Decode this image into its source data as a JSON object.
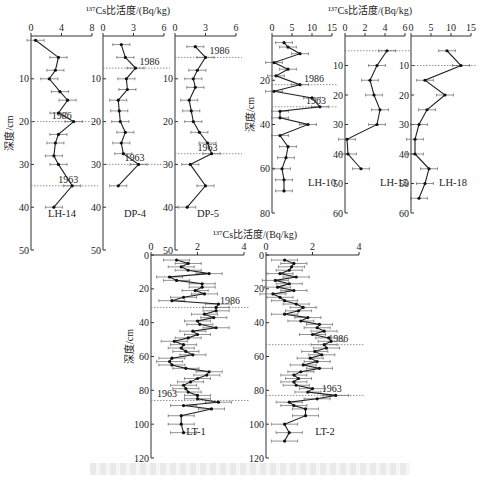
{
  "figure": {
    "top_group_title": "¹³⁷Cs比活度/(Bq/kg)",
    "bottom_group_title": "¹³⁷Cs比活度/(Bq/kg)",
    "ylabel": "深度/cm",
    "caption": "图   ¹³⁷Cs比活度随深度变化"
  },
  "chart_data": [
    {
      "type": "line",
      "title": "LH-14",
      "xlabel": "¹³⁷Cs比活度/(Bq/kg)",
      "ylabel": "深度/cm",
      "xlim": [
        0,
        8
      ],
      "xticks": [
        0,
        4,
        8
      ],
      "ylim": [
        0,
        50
      ],
      "yticks": [
        10,
        20,
        30,
        40,
        50
      ],
      "depth": [
        1,
        5,
        8,
        10,
        13,
        15,
        18,
        20,
        23,
        25,
        28,
        30,
        35,
        40
      ],
      "values": [
        0.6,
        3.6,
        3.2,
        2.4,
        3.8,
        4.8,
        3.6,
        5.6,
        3.6,
        3.2,
        3.0,
        3.6,
        5.4,
        3.0
      ],
      "markers": [
        {
          "label": "1986",
          "depth": 20
        },
        {
          "label": "1963",
          "depth": 35
        }
      ]
    },
    {
      "type": "line",
      "title": "DP-4",
      "xlabel": "¹³⁷Cs比活度/(Bq/kg)",
      "ylabel": "深度/cm",
      "xlim": [
        0,
        6
      ],
      "xticks": [
        0,
        3,
        6
      ],
      "ylim": [
        0,
        50
      ],
      "yticks": [
        10,
        20,
        30,
        40,
        50
      ],
      "depth": [
        2,
        5,
        7.5,
        10,
        12.5,
        15,
        17.5,
        20,
        22.5,
        25,
        27.5,
        30,
        35
      ],
      "values": [
        1.8,
        2.2,
        3.2,
        2.3,
        2.4,
        1.5,
        1.6,
        1.7,
        2.2,
        1.8,
        2.0,
        3.5,
        1.5
      ],
      "markers": [
        {
          "label": "1986",
          "depth": 7.5
        },
        {
          "label": "1963",
          "depth": 30
        }
      ]
    },
    {
      "type": "line",
      "title": "DP-5",
      "xlabel": "¹³⁷Cs比活度/(Bq/kg)",
      "ylabel": "深度/cm",
      "xlim": [
        0,
        6
      ],
      "xticks": [
        0,
        3,
        6
      ],
      "ylim": [
        0,
        50
      ],
      "yticks": [
        10,
        20,
        30,
        40,
        50
      ],
      "depth": [
        2.5,
        5,
        8,
        10,
        12,
        15,
        17.5,
        20,
        22.5,
        25,
        27.5,
        30,
        35,
        40
      ],
      "values": [
        2.0,
        3.0,
        2.2,
        1.8,
        2.0,
        1.4,
        1.6,
        1.8,
        2.4,
        3.2,
        3.6,
        1.5,
        3.0,
        1.2
      ],
      "markers": [
        {
          "label": "1986",
          "depth": 5
        },
        {
          "label": "1963",
          "depth": 27.5
        }
      ]
    },
    {
      "type": "line",
      "title": "LH-10",
      "xlabel": "¹³⁷Cs比活度/(Bq/kg)",
      "ylabel": "深度/cm",
      "xlim": [
        0,
        15
      ],
      "xticks": [
        0,
        5,
        10,
        15
      ],
      "ylim": [
        0,
        80
      ],
      "yticks": [
        20,
        40,
        60,
        80
      ],
      "depth": [
        3,
        5,
        8,
        12,
        15,
        18,
        22,
        25,
        28,
        32,
        34,
        37,
        40,
        45,
        50,
        55,
        60,
        65,
        70
      ],
      "values": [
        3,
        4,
        7,
        0.5,
        4,
        1,
        7,
        0.5,
        10,
        12,
        2,
        2,
        9,
        2,
        4,
        3.5,
        2.5,
        3,
        3
      ],
      "markers": [
        {
          "label": "1986",
          "depth": 22
        },
        {
          "label": "1963",
          "depth": 32
        }
      ]
    },
    {
      "type": "line",
      "title": "LH-15",
      "xlabel": "¹³⁷Cs比活度/(Bq/kg)",
      "ylabel": "深度/cm",
      "xlim": [
        0,
        6
      ],
      "xticks": [
        0,
        2,
        4,
        6
      ],
      "ylim": [
        0,
        60
      ],
      "yticks": [
        10,
        20,
        30,
        40,
        50,
        60
      ],
      "depth": [
        5,
        10,
        15,
        20,
        25,
        30,
        35,
        40,
        45
      ],
      "values": [
        4.2,
        3.2,
        2.5,
        2.9,
        3.5,
        3.2,
        0.2,
        0.3,
        1.6
      ],
      "markers": [
        {
          "label": "",
          "depth": 5
        }
      ]
    },
    {
      "type": "line",
      "title": "LH-18",
      "xlabel": "¹³⁷Cs比活度/(Bq/kg)",
      "ylabel": "深度/cm",
      "xlim": [
        0,
        15
      ],
      "xticks": [
        0,
        5,
        10,
        15
      ],
      "ylim": [
        0,
        60
      ],
      "yticks": [
        10,
        20,
        30,
        40,
        50,
        60
      ],
      "depth": [
        5,
        10,
        15,
        20,
        25,
        30,
        35,
        40,
        45,
        50,
        55
      ],
      "values": [
        9,
        12.5,
        3.5,
        8.5,
        4.0,
        2.0,
        1.0,
        1.0,
        4.5,
        3.5,
        2.0
      ],
      "markers": [
        {
          "label": "",
          "depth": 10
        }
      ]
    },
    {
      "type": "line",
      "title": "LT-1",
      "xlabel": "¹³⁷Cs比活度/(Bq/kg)",
      "ylabel": "深度/cm",
      "xlim": [
        0,
        4
      ],
      "xticks": [
        0,
        2,
        4
      ],
      "ylim": [
        0,
        120
      ],
      "yticks": [
        0,
        20,
        40,
        60,
        80,
        100,
        120
      ],
      "depth": [
        3,
        5,
        7,
        9,
        11,
        13,
        15,
        17,
        19,
        21,
        23,
        25,
        27,
        29,
        31,
        33,
        35,
        37,
        39,
        41,
        43,
        45,
        47,
        49,
        51,
        53,
        55,
        57,
        59,
        61,
        63,
        65,
        67,
        69,
        71,
        73,
        75,
        77,
        79,
        81,
        83,
        85,
        87,
        89,
        91,
        95,
        100,
        105
      ],
      "values": [
        1.1,
        1.6,
        1.3,
        1.6,
        2.5,
        0.8,
        1.1,
        2.2,
        2.2,
        1.9,
        2.3,
        1.4,
        0.9,
        2.9,
        2.8,
        2.8,
        2.3,
        2.7,
        2.0,
        2.1,
        2.8,
        1.8,
        2.0,
        1.6,
        1.0,
        1.4,
        1.3,
        1.5,
        1.8,
        0.9,
        0.8,
        0.9,
        1.5,
        2.5,
        2.4,
        2.0,
        1.7,
        1.4,
        1.5,
        1.6,
        2.0,
        2.0,
        2.9,
        1.4,
        2.6,
        1.3,
        1.3,
        1.4
      ],
      "markers": [
        {
          "label": "1986",
          "depth": 31
        },
        {
          "label": "1963",
          "depth": 86
        }
      ]
    },
    {
      "type": "line",
      "title": "LT-2",
      "xlabel": "¹³⁷Cs比活度/(Bq/kg)",
      "ylabel": "深度/cm",
      "xlim": [
        0,
        4
      ],
      "xticks": [
        0,
        2,
        4
      ],
      "ylim": [
        0,
        120
      ],
      "yticks": [
        0,
        20,
        40,
        60,
        80,
        100,
        120
      ],
      "depth": [
        3,
        5,
        7,
        9,
        11,
        13,
        15,
        17,
        19,
        21,
        23,
        25,
        27,
        29,
        31,
        33,
        35,
        37,
        39,
        41,
        43,
        45,
        47,
        49,
        51,
        53,
        55,
        57,
        59,
        61,
        63,
        65,
        67,
        69,
        71,
        73,
        75,
        77,
        79,
        81,
        83,
        85,
        87,
        89,
        91,
        95,
        100,
        105,
        110
      ],
      "values": [
        0.8,
        1.2,
        1.1,
        1.0,
        0.6,
        1.3,
        0.4,
        1.0,
        0.5,
        1.2,
        0.3,
        0.6,
        0.8,
        1.3,
        1.6,
        1.4,
        0.8,
        1.8,
        1.5,
        2.3,
        2.2,
        2.5,
        2.0,
        2.7,
        2.8,
        2.5,
        2.6,
        2.1,
        2.4,
        1.9,
        2.2,
        1.6,
        2.3,
        1.5,
        1.2,
        1.4,
        1.2,
        1.3,
        2.0,
        1.8,
        3.0,
        2.2,
        1.0,
        1.2,
        1.7,
        1.7,
        0.8,
        1.0,
        0.8
      ],
      "markers": [
        {
          "label": "1986",
          "depth": 53
        },
        {
          "label": "1963",
          "depth": 83
        }
      ]
    }
  ]
}
